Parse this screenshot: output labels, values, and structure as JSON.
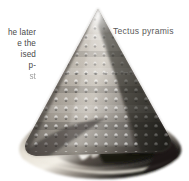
{
  "page": {
    "background_color": "#ffffff",
    "kind": "book-figure"
  },
  "body_text": {
    "note": "body-text column clipped by the left edge of the crop",
    "lines": [
      "he later",
      "e  the",
      "ised",
      "p-",
      "st"
    ],
    "color": "#4a4a4a"
  },
  "caption": {
    "species_label": "Tectus pyramis",
    "color": "#5a5a5a"
  },
  "figure": {
    "icon": "shell-icon",
    "orientation": "apex up, aperture toward lower left",
    "palette": {
      "highlight": "#f2efe9",
      "light": "#cfc9c0",
      "mid": "#8e8880",
      "dark": "#4a453f",
      "darkest": "#1d1b19",
      "base_cream": "#e8e3d8"
    }
  }
}
